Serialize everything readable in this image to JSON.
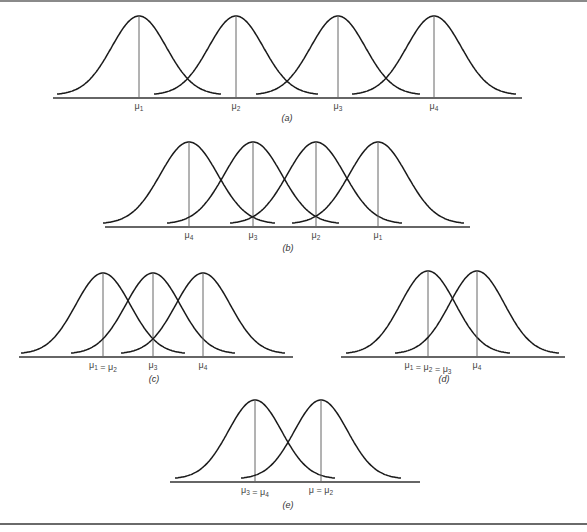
{
  "figure": {
    "panels": [
      {
        "id": "a",
        "caption": "(a)",
        "labels": [
          "μ1",
          "μ2",
          "μ3",
          "μ4"
        ]
      },
      {
        "id": "b",
        "caption": "(b)",
        "labels": [
          "μ4",
          "μ3",
          "μ2",
          "μ1"
        ]
      },
      {
        "id": "c",
        "caption": "(c)",
        "labels": [
          "μ1 = μ2",
          "μ3",
          "μ4"
        ]
      },
      {
        "id": "d",
        "caption": "(d)",
        "labels": [
          "μ1 = μ2 = μ3",
          "μ4"
        ]
      },
      {
        "id": "e",
        "caption": "(e)",
        "labels": [
          "μ3 = μ4",
          "μ = μ2"
        ]
      }
    ]
  },
  "chart_data": [
    {
      "type": "line",
      "title": "(a)",
      "description": "Four normal curves, equally spaced and widely separated",
      "layout": {
        "axis_x": [
          53,
          522
        ],
        "baseline_y": 98,
        "peak_y": 16,
        "half_width": 82
      },
      "series": [
        {
          "name": "μ1",
          "mean_x": 139
        },
        {
          "name": "μ2",
          "mean_x": 236
        },
        {
          "name": "μ3",
          "mean_x": 338
        },
        {
          "name": "μ4",
          "mean_x": 434
        }
      ],
      "tick_labels": [
        "μ1",
        "μ2",
        "μ3",
        "μ4"
      ],
      "grid": false,
      "legend": "none"
    },
    {
      "type": "line",
      "title": "(b)",
      "description": "Four normal curves, closely spaced, order reversed",
      "layout": {
        "axis_x": [
          105,
          470
        ],
        "baseline_y": 227,
        "peak_y": 142,
        "half_width": 86
      },
      "series": [
        {
          "name": "μ4",
          "mean_x": 189
        },
        {
          "name": "μ3",
          "mean_x": 253
        },
        {
          "name": "μ2",
          "mean_x": 316
        },
        {
          "name": "μ1",
          "mean_x": 378
        }
      ],
      "tick_labels": [
        "μ4",
        "μ3",
        "μ2",
        "μ1"
      ],
      "grid": false,
      "legend": "none"
    },
    {
      "type": "line",
      "title": "(c)",
      "description": "Three normal curves; μ1 and μ2 coincide",
      "layout": {
        "axis_x": [
          19,
          293
        ],
        "baseline_y": 357,
        "peak_y": 273,
        "half_width": 82
      },
      "series": [
        {
          "name": "μ1 = μ2",
          "mean_x": 103
        },
        {
          "name": "μ3",
          "mean_x": 153
        },
        {
          "name": "μ4",
          "mean_x": 203
        }
      ],
      "tick_labels": [
        "μ1 = μ2",
        "μ3",
        "μ4"
      ],
      "grid": false,
      "legend": "none"
    },
    {
      "type": "line",
      "title": "(d)",
      "description": "Two normal curves; μ1, μ2, μ3 coincide",
      "layout": {
        "axis_x": [
          341,
          565
        ],
        "baseline_y": 357,
        "peak_y": 271,
        "half_width": 82
      },
      "series": [
        {
          "name": "μ1 = μ2 = μ3",
          "mean_x": 428
        },
        {
          "name": "μ4",
          "mean_x": 477
        }
      ],
      "tick_labels": [
        "μ1 = μ2 = μ3",
        "μ4"
      ],
      "grid": false,
      "legend": "none"
    },
    {
      "type": "line",
      "title": "(e)",
      "description": "Two normal curves; μ3 = μ4 and μ = μ2",
      "layout": {
        "axis_x": [
          170,
          420
        ],
        "baseline_y": 482,
        "peak_y": 400,
        "half_width": 80
      },
      "series": [
        {
          "name": "μ3 = μ4",
          "mean_x": 255
        },
        {
          "name": "μ = μ2",
          "mean_x": 321
        }
      ],
      "tick_labels": [
        "μ3 = μ4",
        "μ = μ2"
      ],
      "grid": false,
      "legend": "none"
    }
  ]
}
